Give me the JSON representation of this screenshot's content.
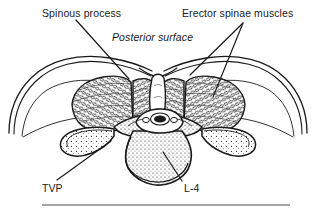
{
  "figure": {
    "type": "anatomical-line-drawing",
    "background_color": "#ffffff",
    "ink_color": "#1a1a1a",
    "width": 316,
    "height": 213,
    "labels": {
      "spinous_process": "Spinous process",
      "erector_spinae": "Erector spinae muscles",
      "posterior_surface": "Posterior surface",
      "tvp": "TVP",
      "l4": "L-4"
    },
    "leader_lines": [
      {
        "name": "spinous-process-leader",
        "from": [
          76,
          20
        ],
        "to": [
          129,
          79
        ]
      },
      {
        "name": "erector-spinae-leader-upper",
        "from": [
          243,
          23
        ],
        "to": [
          190,
          75
        ]
      },
      {
        "name": "erector-spinae-leader-lower",
        "from": [
          243,
          23
        ],
        "to": [
          213,
          97
        ]
      },
      {
        "name": "tvp-leader",
        "from": [
          57,
          180
        ],
        "to": [
          111,
          141
        ]
      },
      {
        "name": "l4-leader",
        "from": [
          182,
          181
        ],
        "to": [
          163,
          152
        ]
      }
    ],
    "rule": {
      "name": "bottom-rule",
      "x1": 42,
      "x2": 290,
      "y": 205
    }
  }
}
